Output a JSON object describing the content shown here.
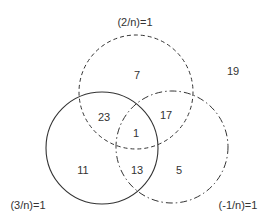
{
  "diagram": {
    "type": "venn",
    "sets": [
      {
        "id": "A",
        "label": "(2/n)=1",
        "line_style": "dashed",
        "cx": 136,
        "cy": 92,
        "r": 57
      },
      {
        "id": "B",
        "label": "(3/n)=1",
        "line_style": "solid",
        "cx": 102,
        "cy": 148,
        "r": 56
      },
      {
        "id": "C",
        "label": "(-1/n)=1",
        "line_style": "dash-dot",
        "cx": 172,
        "cy": 147,
        "r": 56
      }
    ],
    "regions": {
      "A_only": "7",
      "outside": "19",
      "A_and_B": "23",
      "A_and_C": "17",
      "A_B_C": "1",
      "B_only": "11",
      "B_and_C": "13",
      "C_only": "5"
    },
    "stroke_color": "#333333"
  }
}
